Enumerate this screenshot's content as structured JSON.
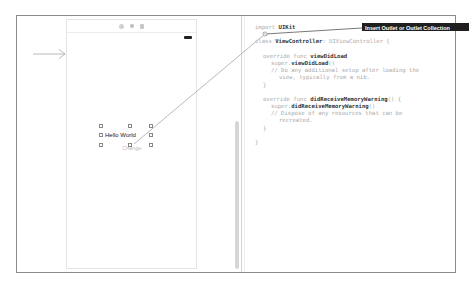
{
  "storyboard": {
    "scene_title_icons": [
      "view-controller-icon",
      "first-responder-icon",
      "exit-icon"
    ],
    "label_text": "Hello World",
    "button_text": "Change"
  },
  "editor": {
    "lines": [
      {
        "indent": 0,
        "parts": [
          {
            "t": "import ",
            "c": "kw"
          },
          {
            "t": "UIKit",
            "c": "id"
          }
        ]
      },
      {
        "indent": 0,
        "parts": [
          {
            "t": "class ",
            "c": "kw"
          },
          {
            "t": "ViewController",
            "c": "id"
          },
          {
            "t": ": UIViewController {",
            "c": "kw"
          }
        ]
      },
      {
        "indent": 1,
        "parts": [
          {
            "t": "override func ",
            "c": "kw"
          },
          {
            "t": "viewDidLoad",
            "c": "id"
          }
        ]
      },
      {
        "indent": 2,
        "parts": [
          {
            "t": "super.",
            "c": "kw"
          },
          {
            "t": "viewDidLoad",
            "c": "id"
          },
          {
            "t": "()",
            "c": "kw"
          }
        ]
      },
      {
        "indent": 2,
        "parts": [
          {
            "t": "// Do any additional setup after loading the",
            "c": "cm"
          }
        ]
      },
      {
        "indent": 3,
        "parts": [
          {
            "t": "view, typically from a nib.",
            "c": "cm"
          }
        ]
      },
      {
        "indent": 1,
        "parts": [
          {
            "t": "}",
            "c": "kw"
          }
        ]
      },
      {
        "indent": 1,
        "parts": [
          {
            "t": "override func ",
            "c": "kw"
          },
          {
            "t": "didReceiveMemoryWarning",
            "c": "id"
          },
          {
            "t": "() {",
            "c": "kw"
          }
        ]
      },
      {
        "indent": 2,
        "parts": [
          {
            "t": "super.",
            "c": "kw"
          },
          {
            "t": "didReceiveMemoryWarning",
            "c": "id"
          },
          {
            "t": "()",
            "c": "kw"
          }
        ]
      },
      {
        "indent": 2,
        "parts": [
          {
            "t": "// Dispose of any resources that can be",
            "c": "cm"
          }
        ]
      },
      {
        "indent": 3,
        "parts": [
          {
            "t": "recreated.",
            "c": "cm"
          }
        ]
      },
      {
        "indent": 1,
        "parts": [
          {
            "t": "}",
            "c": "kw"
          }
        ]
      },
      {
        "indent": 0,
        "parts": [
          {
            "t": "}",
            "c": "kw"
          }
        ]
      }
    ]
  },
  "tooltip": {
    "text": "Insert Outlet or Outlet Collection"
  }
}
